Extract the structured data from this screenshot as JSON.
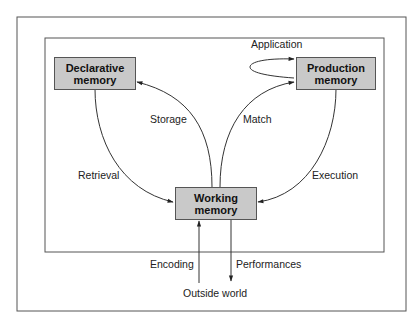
{
  "diagram": {
    "nodes": {
      "declarative": {
        "line1": "Declarative",
        "line2": "memory"
      },
      "production": {
        "line1": "Production",
        "line2": "memory"
      },
      "working": {
        "line1": "Working",
        "line2": "memory"
      }
    },
    "edges": {
      "application": "Application",
      "storage": "Storage",
      "match": "Match",
      "retrieval": "Retrieval",
      "execution": "Execution",
      "encoding": "Encoding",
      "performances": "Performances"
    },
    "external": {
      "outside_world": "Outside world"
    },
    "colors": {
      "box_fill": "#c9c9c9",
      "line": "#333333",
      "background": "#ffffff"
    }
  }
}
